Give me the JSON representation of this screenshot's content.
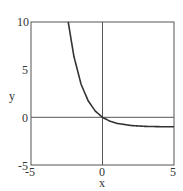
{
  "chart_data": {
    "type": "line",
    "title": "",
    "xlabel": "x",
    "ylabel": "y",
    "xlim": [
      -5,
      5
    ],
    "ylim": [
      -5,
      10
    ],
    "xticks": [
      "-5",
      "0",
      "5"
    ],
    "yticks": [
      "-5",
      "0",
      "5",
      "10"
    ],
    "grid": false,
    "legend": null,
    "reference_lines": {
      "x": 0,
      "y": 0
    },
    "series": [
      {
        "name": "y = e^(-x) - 1",
        "x": [
          -2.4,
          -2.0,
          -1.5,
          -1.0,
          -0.5,
          0,
          0.5,
          1,
          2,
          3,
          4,
          5
        ],
        "values": [
          10.02,
          6.39,
          3.48,
          1.72,
          0.65,
          0,
          -0.39,
          -0.63,
          -0.86,
          -0.95,
          -0.98,
          -0.99
        ]
      }
    ]
  },
  "labels": {
    "x_axis": "x",
    "y_axis": "y",
    "x_tick_min": "-5",
    "x_tick_mid": "0",
    "x_tick_max": "5",
    "y_tick_10": "10",
    "y_tick_5": "5",
    "y_tick_0": "0",
    "y_tick_neg5": "-5"
  },
  "colors": {
    "axis": "#555555",
    "curve": "#333333"
  }
}
